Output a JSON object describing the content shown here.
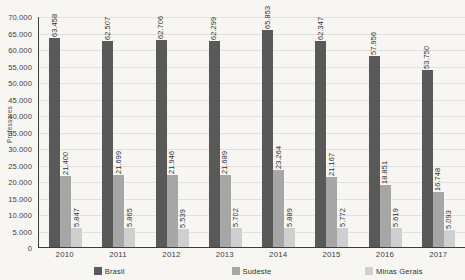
{
  "chart_data": {
    "type": "bar",
    "title": "",
    "subtitle": "",
    "xlabel": "",
    "ylabel": "Professores",
    "ylim": [
      0,
      70000
    ],
    "grid": true,
    "legend_position": "bottom",
    "orientation": "vertical",
    "grouping": "grouped",
    "categories": [
      "2010",
      "2011",
      "2012",
      "2013",
      "2014",
      "2015",
      "2016",
      "2017"
    ],
    "y_ticks": [
      "70.000",
      "65.000",
      "60.000",
      "55.000",
      "50.000",
      "45.000",
      "40.000",
      "35.000",
      "30.000",
      "25.000",
      "20.000",
      "15.000",
      "10.000",
      "5.000",
      "0"
    ],
    "y_tick_values": [
      70000,
      65000,
      60000,
      55000,
      50000,
      45000,
      40000,
      35000,
      30000,
      25000,
      20000,
      15000,
      10000,
      5000,
      0
    ],
    "series": [
      {
        "name": "Brasil",
        "color": "#595959",
        "values": [
          63458,
          62507,
          62706,
          62299,
          65853,
          62347,
          57956,
          53750
        ],
        "labels": [
          "63.458",
          "62.507",
          "62.706",
          "62.299",
          "65.853",
          "62.347",
          "57.956",
          "53.750"
        ]
      },
      {
        "name": "Sudeste",
        "color": "#a6a6a6",
        "values": [
          21400,
          21699,
          21946,
          21689,
          23264,
          21167,
          18851,
          16748
        ],
        "labels": [
          "21.400",
          "21.699",
          "21.946",
          "21.689",
          "23.264",
          "21.167",
          "18.851",
          "16.748"
        ]
      },
      {
        "name": "Minas Gerais",
        "color": "#cfcfcf",
        "values": [
          5847,
          5865,
          5539,
          5702,
          5889,
          5772,
          5619,
          5093
        ],
        "labels": [
          "5.847",
          "5.865",
          "5.539",
          "5.702",
          "5.889",
          "5.772",
          "5.619",
          "5.093"
        ]
      }
    ]
  },
  "colors": {
    "background": "#f8f6f3",
    "gridline": "#e2e0dd",
    "axis": "#3c3c3c",
    "text": "#2e2e2e",
    "series_brasil": "#595959",
    "series_sudeste": "#a6a6a6",
    "series_minas_gerais": "#cfcfcf"
  }
}
